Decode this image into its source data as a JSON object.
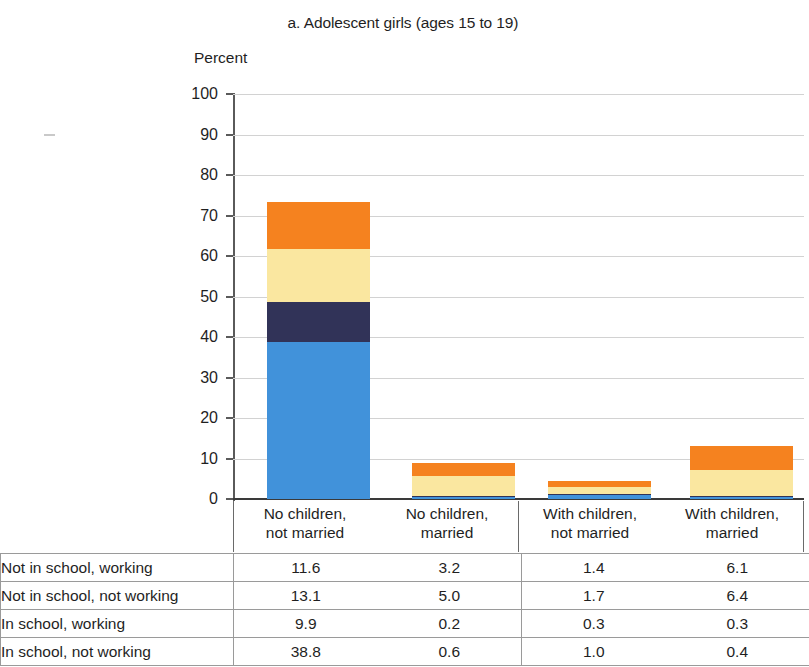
{
  "chart_data": {
    "type": "bar",
    "subtype": "stacked-bar",
    "title": "a. Adolescent girls (ages 15 to 19)",
    "xlabel": "",
    "ylabel": "Percent",
    "ylim": [
      0,
      100
    ],
    "yticks": [
      "0",
      "10",
      "20",
      "30",
      "40",
      "50",
      "60",
      "70",
      "80",
      "90",
      "100"
    ],
    "grid": true,
    "legend": "none",
    "categories": [
      "No children,\nnot married",
      "No children,\nmarried",
      "With children,\nnot married",
      "With children,\nmarried"
    ],
    "category_lines": [
      [
        "No children,",
        "not married"
      ],
      [
        "No children,",
        "married"
      ],
      [
        "With children,",
        "not married"
      ],
      [
        "With children,",
        "married"
      ]
    ],
    "series": [
      {
        "name": "In school, not working",
        "color": "#4192da",
        "values": [
          38.8,
          0.6,
          1.0,
          0.4
        ]
      },
      {
        "name": "In school, working",
        "color": "#313358",
        "values": [
          9.9,
          0.2,
          0.3,
          0.3
        ]
      },
      {
        "name": "Not in school, not working",
        "color": "#fae7a0",
        "values": [
          13.1,
          5.0,
          1.7,
          6.4
        ]
      },
      {
        "name": "Not in school, working",
        "color": "#f5821f",
        "values": [
          11.6,
          3.2,
          1.4,
          6.1
        ]
      }
    ],
    "stack_order_bottom_to_top": [
      "In school, not working",
      "In school, working",
      "Not in school, not working",
      "Not in school, working"
    ],
    "totals": [
      73.4,
      9.0,
      4.4,
      13.2
    ]
  },
  "table": {
    "rows": [
      {
        "label": "Not in school, working",
        "values": [
          "11.6",
          "3.2",
          "1.4",
          "6.1"
        ]
      },
      {
        "label": "Not in school, not working",
        "values": [
          "13.1",
          "5.0",
          "1.7",
          "6.4"
        ]
      },
      {
        "label": "In school, working",
        "values": [
          "9.9",
          "0.2",
          "0.3",
          "0.3"
        ]
      },
      {
        "label": "In school, not working",
        "values": [
          "38.8",
          "0.6",
          "1.0",
          "0.4"
        ]
      }
    ]
  },
  "colors": {
    "blue": "#4192da",
    "navy": "#313358",
    "yellow": "#fae7a0",
    "orange": "#f5821f",
    "gridline": "#d2d2d2",
    "axis": "#5a5a5a"
  }
}
